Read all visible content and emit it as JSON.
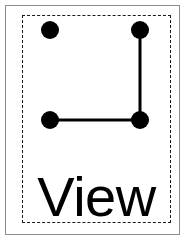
{
  "card": {
    "label": "View",
    "background_color": "#ffffff",
    "outer_border_color": "#8d8d8d",
    "inner_border_color": "#1a1a1a",
    "inner_border_style": "dashed",
    "ink_color": "#000000"
  },
  "caption": {
    "text": "View"
  },
  "diagram": {
    "type": "node-link",
    "node_radius": 9,
    "edge_width": 3,
    "nodes": [
      {
        "id": "top-left",
        "name": "node-top-left",
        "x": 28,
        "y": 15,
        "connected": false
      },
      {
        "id": "top-right",
        "name": "node-top-right",
        "x": 118,
        "y": 15,
        "connected": true
      },
      {
        "id": "bottom-left",
        "name": "node-bottom-left",
        "x": 28,
        "y": 105,
        "connected": true
      },
      {
        "id": "bottom-right",
        "name": "node-bottom-right",
        "x": 118,
        "y": 105,
        "connected": true
      }
    ],
    "edges": [
      {
        "id": "edge-right-vertical",
        "name": "edge-top-right-to-bottom-right",
        "from": "top-right",
        "to": "bottom-right",
        "x1": 118,
        "y1": 15,
        "x2": 118,
        "y2": 105
      },
      {
        "id": "edge-bottom-horizontal",
        "name": "edge-bottom-right-to-bottom-left",
        "from": "bottom-right",
        "to": "bottom-left",
        "x1": 118,
        "y1": 105,
        "x2": 28,
        "y2": 105
      }
    ]
  }
}
